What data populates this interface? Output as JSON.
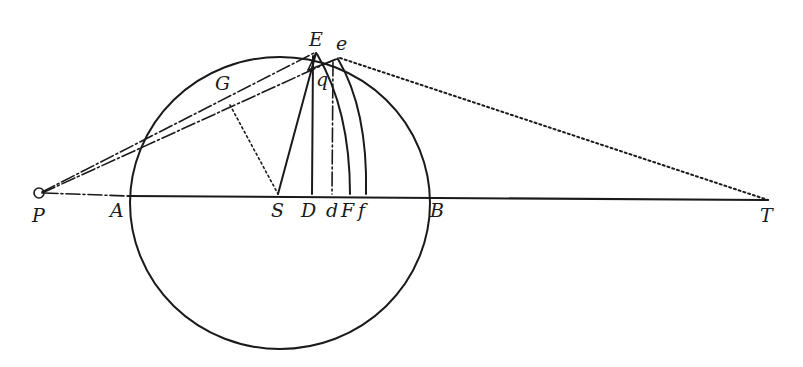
{
  "diagram": {
    "type": "geometric-construction",
    "labels": {
      "P": "P",
      "A": "A",
      "S": "S",
      "D": "D",
      "d": "d",
      "F": "F",
      "f": "f",
      "B": "B",
      "T": "T",
      "E": "E",
      "e": "e",
      "G": "G",
      "q": "q"
    },
    "points": {
      "P": [
        40,
        193
      ],
      "A": [
        128,
        196
      ],
      "S": [
        278,
        196
      ],
      "D": [
        312,
        196
      ],
      "d": [
        332,
        196
      ],
      "F": [
        350,
        196
      ],
      "f": [
        366,
        196
      ],
      "B": [
        428,
        196
      ],
      "T": [
        768,
        200
      ],
      "E": [
        315,
        55
      ],
      "e": [
        338,
        60
      ],
      "G": [
        230,
        98
      ],
      "q": [
        322,
        72
      ]
    },
    "circle": {
      "cx": 280,
      "cy": 196,
      "r": 150
    },
    "colors": {
      "ink": "#1a1a1a",
      "paper": "#ffffff"
    }
  }
}
